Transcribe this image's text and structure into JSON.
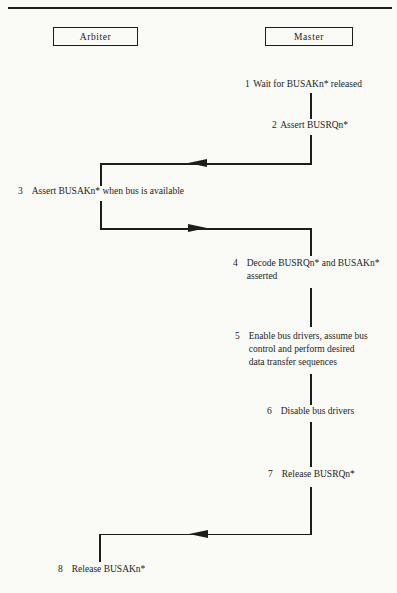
{
  "page": {
    "background": "#fafaf6",
    "line_color": "#1d1d1b",
    "text_color": "#1d1d1b"
  },
  "header": {
    "arbiter_label": "Arbiter",
    "master_label": "Master"
  },
  "steps": [
    {
      "number": "1",
      "lane": "master",
      "lines": [
        "Wait for BUSAKn* released"
      ]
    },
    {
      "number": "2",
      "lane": "master",
      "lines": [
        "Assert BUSRQn*"
      ]
    },
    {
      "number": "3",
      "lane": "arbiter",
      "lines": [
        "Assert BUSAKn* when bus is available"
      ]
    },
    {
      "number": "4",
      "lane": "master",
      "lines": [
        "Decode BUSRQn* and BUSAKn*",
        "asserted"
      ]
    },
    {
      "number": "5",
      "lane": "master",
      "lines": [
        "Enable bus drivers, assume bus",
        "control and perform desired",
        "data transfer sequences"
      ]
    },
    {
      "number": "6",
      "lane": "master",
      "lines": [
        "Disable bus drivers"
      ]
    },
    {
      "number": "7",
      "lane": "master",
      "lines": [
        "Release BUSRQn*"
      ]
    },
    {
      "number": "8",
      "lane": "arbiter",
      "lines": [
        "Release BUSAKn*"
      ]
    }
  ],
  "connectors": [
    {
      "from": "2",
      "to": "3",
      "direction": "left"
    },
    {
      "from": "3",
      "to": "4",
      "direction": "right"
    },
    {
      "from": "7",
      "to": "8",
      "direction": "left"
    }
  ]
}
